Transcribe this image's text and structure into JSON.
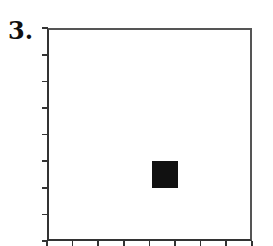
{
  "problem": {
    "label": "3."
  },
  "grid": {
    "columns": 8,
    "rows": 8,
    "origin_px": {
      "x": 47,
      "y": 241
    },
    "cell_w_px": 25.6,
    "cell_h_px": 26.6,
    "axis_color": "#333333",
    "frame_color": "#555555"
  },
  "filled_cells": [
    {
      "col": 4,
      "row_from_bottom": 2,
      "color": "#111111"
    }
  ]
}
